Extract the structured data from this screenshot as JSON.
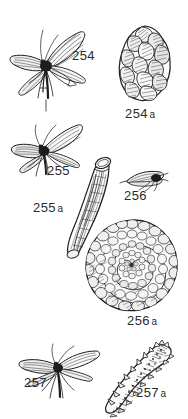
{
  "plate": {
    "title": "Caddisfly adults and larval cases",
    "background_color": "#ffffff",
    "ink_color": "#1d1d1d",
    "caption_color": "#2b2b2b",
    "width": 188,
    "height": 419
  },
  "figures": [
    {
      "id": "254",
      "number": "254",
      "suffix": "",
      "caption": "254",
      "subject": "adult-caddisfly-winged",
      "description": "Adult caddisfly with four hatched wings spread, long antennae and trailing legs",
      "kind": "adult-insect"
    },
    {
      "id": "254a",
      "number": "254",
      "suffix": "a",
      "caption": "254 a",
      "subject": "larval-case-pebble-oval",
      "description": "Oval larval case constructed from overlapping pebbles and stone fragments",
      "kind": "larval-case"
    },
    {
      "id": "255",
      "number": "255",
      "suffix": "",
      "caption": "255",
      "subject": "adult-caddisfly-winged",
      "description": "Adult caddisfly with broad veined wings angled upward and antennae forward",
      "kind": "adult-insect"
    },
    {
      "id": "255a",
      "number": "255",
      "suffix": "a",
      "caption": "255 a",
      "subject": "larval-case-tube-straw",
      "description": "Long slightly curved tubular case of plant stem with larva visible within",
      "kind": "larval-case"
    },
    {
      "id": "256",
      "number": "256",
      "suffix": "",
      "caption": "256",
      "subject": "adult-caddisfly-small",
      "description": "Small adult caddisfly in side view with folded roof-like wings",
      "kind": "adult-insect"
    },
    {
      "id": "256a",
      "number": "256",
      "suffix": "a",
      "caption": "256 a",
      "subject": "larval-case-spiral-snail",
      "description": "Spiral snail-shell-shaped case built from sand grains and small stones",
      "kind": "larval-case"
    },
    {
      "id": "257",
      "number": "257",
      "suffix": "",
      "caption": "257",
      "subject": "adult-caddisfly-winged",
      "description": "Adult caddisfly with slender outstretched wings, long antennae and legs",
      "kind": "adult-insect"
    },
    {
      "id": "257a",
      "number": "257",
      "suffix": "a",
      "caption": "257 a",
      "subject": "larval-case-detritus-curved",
      "description": "Curved tapering case of coarse plant detritus and sand with ragged edge",
      "kind": "larval-case"
    }
  ],
  "captions": {
    "fig254": "254",
    "fig254a_num": "254",
    "fig254a_sfx": "a",
    "fig255": "255",
    "fig255a_num": "255",
    "fig255a_sfx": "a",
    "fig256": "256",
    "fig256a_num": "256",
    "fig256a_sfx": "a",
    "fig257": "257",
    "fig257a_num": "257",
    "fig257a_sfx": "a"
  }
}
